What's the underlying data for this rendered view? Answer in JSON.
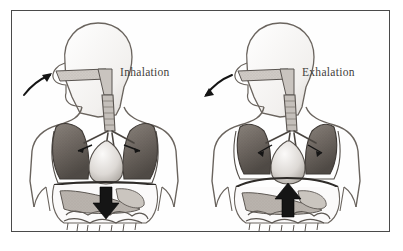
{
  "figure": {
    "title_visible": false,
    "frame_color": "#4a4a4a",
    "background_color": "#ffffff",
    "ink_color": "#5a5550",
    "lung_fill": "#6e6862",
    "arrow_color": "#1a1a1a"
  },
  "panels": [
    {
      "id": "inhalation",
      "label": "Inhalation",
      "diaphragm_arrow": "down-arrow-icon",
      "airflow_arrow": "inward-curved-arrow-icon",
      "airflow_direction": "in",
      "lung_state": "expanded",
      "diaphragm_state": "contracted-flattened-descends"
    },
    {
      "id": "exhalation",
      "label": "Exhalation",
      "diaphragm_arrow": "up-arrow-icon",
      "airflow_arrow": "outward-curved-arrow-icon",
      "airflow_direction": "out",
      "lung_state": "recoiled",
      "diaphragm_state": "relaxed-domed-ascends"
    }
  ],
  "anatomy_parts": [
    "head",
    "nasal-cavity",
    "oral-cavity",
    "pharynx",
    "trachea",
    "bronchi",
    "left-lung",
    "right-lung",
    "heart",
    "diaphragm",
    "liver",
    "stomach",
    "intestines",
    "torso-outline",
    "arms"
  ]
}
